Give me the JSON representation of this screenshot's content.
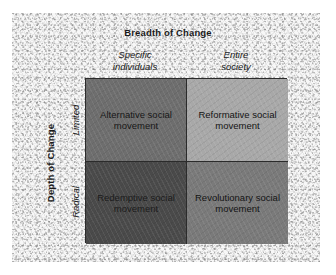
{
  "diagram": {
    "x_axis_title": "Breadth of Change",
    "y_axis_title": "Depth of Change",
    "column_headers": [
      "Specific\nindividuals",
      "Entire\nsociety"
    ],
    "row_headers": [
      "Limited",
      "Radical"
    ],
    "cells": [
      [
        {
          "label": "Alternative social movement",
          "color": "#6e6e6e",
          "text_color": "#171717"
        },
        {
          "label": "Reformative social movement",
          "color": "#a8a8a8",
          "text_color": "#141414"
        }
      ],
      [
        {
          "label": "Redemptive social movement",
          "color": "#4a4a4a",
          "text_color": "#1b1b1b"
        },
        {
          "label": "Revolutionary social movement",
          "color": "#7a7a7a",
          "text_color": "#141414"
        }
      ]
    ],
    "border_color": "#2b2b2b",
    "background_color": "#f7f7f7"
  }
}
